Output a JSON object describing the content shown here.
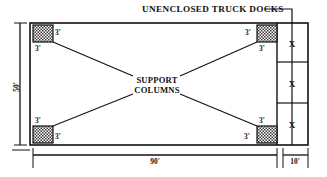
{
  "diagram": {
    "title": "UNENCLOSED TRUCK DOCKS",
    "center_label_line1": "SUPPORT",
    "center_label_line2": "COLUMNS",
    "dimensions": {
      "width_main": "90'",
      "height_left": "50'",
      "width_dock": "10'"
    },
    "column_size_labels": [
      "3'",
      "3'",
      "3'",
      "3'",
      "3'",
      "3'",
      "3'",
      "3'"
    ],
    "dock_bay_marks": [
      "X",
      "X",
      "X"
    ],
    "colors": {
      "line": "#111111",
      "column_fill": "#9a9a9a",
      "background": "#ffffff"
    }
  }
}
